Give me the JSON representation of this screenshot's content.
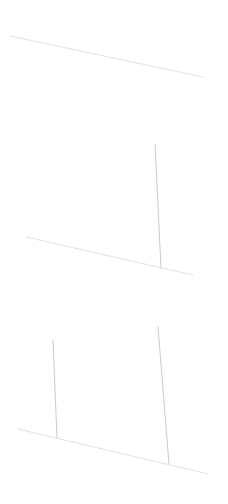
{
  "canvas": {
    "width": 228,
    "height": 504,
    "background": "#ffffff",
    "description": "Faint hairline strokes on a white field"
  },
  "palette": {
    "background": "#ffffff",
    "horizontal_stroke": "#dedee2",
    "vertical_stroke": "#c4c4c9",
    "vertical_stroke_faint": "#dcdce0"
  },
  "groups": [
    {
      "name": "top-group",
      "label": "Top slanted rule",
      "strokes": [
        {
          "name": "top-baseline",
          "kind": "horizontal",
          "x1": 10,
          "y1": 36,
          "x2": 203,
          "y2": 77,
          "color": "#dedee2",
          "width": 1.0,
          "opacity": 0.95
        }
      ]
    },
    {
      "name": "middle-group",
      "label": "Middle rule with single riser",
      "strokes": [
        {
          "name": "middle-baseline",
          "kind": "horizontal",
          "x1": 26,
          "y1": 237,
          "x2": 193,
          "y2": 275,
          "color": "#dedee2",
          "width": 1.0,
          "opacity": 0.95
        },
        {
          "name": "middle-riser",
          "kind": "vertical",
          "x1": 155,
          "y1": 144,
          "x2": 161,
          "y2": 268,
          "color": "#c4c4c9",
          "width": 0.9,
          "opacity": 1.0
        }
      ]
    },
    {
      "name": "bottom-group",
      "label": "Bottom rule with two risers",
      "strokes": [
        {
          "name": "bottom-baseline",
          "kind": "horizontal",
          "x1": 18,
          "y1": 429,
          "x2": 208,
          "y2": 474,
          "color": "#dedee2",
          "width": 1.0,
          "opacity": 0.95
        },
        {
          "name": "bottom-riser-left",
          "kind": "vertical",
          "x1": 53,
          "y1": 340,
          "x2": 57,
          "y2": 438,
          "color": "#c4c4c9",
          "width": 0.9,
          "opacity": 1.0
        },
        {
          "name": "bottom-riser-right",
          "kind": "vertical",
          "x1": 158,
          "y1": 327,
          "x2": 169,
          "y2": 464,
          "color": "#c4c4c9",
          "width": 0.9,
          "opacity": 1.0
        }
      ]
    }
  ]
}
